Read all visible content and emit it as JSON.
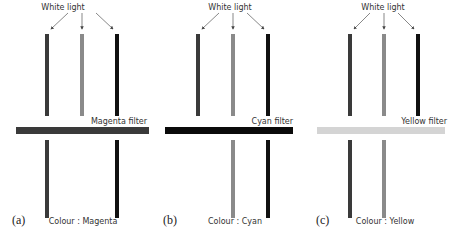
{
  "figure": {
    "panels": [
      {
        "id": "a",
        "panel_label": "(a)",
        "source_label": "White light",
        "filter_label": "Magenta filter",
        "result_label": "Colour : Magenta",
        "filter_color": "#3a3a3a",
        "beams_in": [
          {
            "name": "red",
            "color": "#3a3a3a"
          },
          {
            "name": "green",
            "color": "#8a8a8a"
          },
          {
            "name": "blue",
            "color": "#111111"
          }
        ],
        "beams_out": [
          {
            "name": "red",
            "color": "#3a3a3a",
            "passed": true
          },
          {
            "name": "green",
            "color": "#8a8a8a",
            "passed": false
          },
          {
            "name": "blue",
            "color": "#111111",
            "passed": true
          }
        ]
      },
      {
        "id": "b",
        "panel_label": "(b)",
        "source_label": "White light",
        "filter_label": "Cyan filter",
        "result_label": "Colour : Cyan",
        "filter_color": "#0a0a0a",
        "beams_in": [
          {
            "name": "red",
            "color": "#3a3a3a"
          },
          {
            "name": "green",
            "color": "#8a8a8a"
          },
          {
            "name": "blue",
            "color": "#111111"
          }
        ],
        "beams_out": [
          {
            "name": "red",
            "color": "#3a3a3a",
            "passed": false
          },
          {
            "name": "green",
            "color": "#8a8a8a",
            "passed": true
          },
          {
            "name": "blue",
            "color": "#111111",
            "passed": true
          }
        ]
      },
      {
        "id": "c",
        "panel_label": "(c)",
        "source_label": "White light",
        "filter_label": "Yellow filter",
        "result_label": "Colour : Yellow",
        "filter_color": "#d4d4d4",
        "beams_in": [
          {
            "name": "red",
            "color": "#3a3a3a"
          },
          {
            "name": "green",
            "color": "#8a8a8a"
          },
          {
            "name": "blue",
            "color": "#111111"
          }
        ],
        "beams_out": [
          {
            "name": "red",
            "color": "#3a3a3a",
            "passed": true
          },
          {
            "name": "green",
            "color": "#8a8a8a",
            "passed": true
          },
          {
            "name": "blue",
            "color": "#111111",
            "passed": false
          }
        ]
      }
    ]
  }
}
